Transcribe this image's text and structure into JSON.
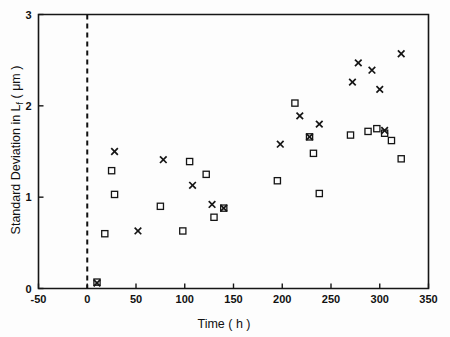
{
  "chart_data": {
    "type": "scatter",
    "title": "",
    "xlabel": "Time ( h )",
    "ylabel_main": "Standard Deviation in L",
    "ylabel_sub": "f",
    "ylabel_units": "( μm )",
    "ylabel_full": "Standard Deviation in Lf ( μm )",
    "xlim": [
      -50,
      350
    ],
    "ylim": [
      0,
      3
    ],
    "xticks": [
      -50,
      0,
      50,
      100,
      150,
      200,
      250,
      300,
      350
    ],
    "xtick_labels": [
      "-50",
      "0",
      "50",
      "100",
      "150",
      "200",
      "250",
      "300",
      "350"
    ],
    "yticks": [
      0,
      1,
      2,
      3
    ],
    "ytick_labels": [
      "0",
      "1",
      "2",
      "3"
    ],
    "grid": false,
    "legend": "none",
    "annotations": [
      {
        "name": "zero-time-reference-line",
        "type": "vertical-dashed-line",
        "x": 0,
        "label": ""
      }
    ],
    "series": [
      {
        "name": "cross-series",
        "marker": "x",
        "color": "#151515",
        "points": [
          [
            10,
            0.06
          ],
          [
            28,
            1.5
          ],
          [
            52,
            0.63
          ],
          [
            78,
            1.41
          ],
          [
            108,
            1.13
          ],
          [
            128,
            0.92
          ],
          [
            140,
            0.88
          ],
          [
            198,
            1.58
          ],
          [
            218,
            1.89
          ],
          [
            228,
            1.66
          ],
          [
            238,
            1.8
          ],
          [
            272,
            2.26
          ],
          [
            278,
            2.47
          ],
          [
            292,
            2.39
          ],
          [
            300,
            2.18
          ],
          [
            305,
            1.73
          ],
          [
            322,
            2.57
          ]
        ]
      },
      {
        "name": "square-series",
        "marker": "square",
        "color": "#151515",
        "points": [
          [
            10,
            0.07
          ],
          [
            18,
            0.6
          ],
          [
            25,
            1.29
          ],
          [
            28,
            1.03
          ],
          [
            75,
            0.9
          ],
          [
            98,
            0.63
          ],
          [
            105,
            1.39
          ],
          [
            122,
            1.25
          ],
          [
            130,
            0.78
          ],
          [
            140,
            0.88
          ],
          [
            195,
            1.18
          ],
          [
            213,
            2.03
          ],
          [
            228,
            1.66
          ],
          [
            232,
            1.48
          ],
          [
            238,
            1.04
          ],
          [
            270,
            1.68
          ],
          [
            288,
            1.72
          ],
          [
            297,
            1.75
          ],
          [
            305,
            1.7
          ],
          [
            312,
            1.62
          ],
          [
            322,
            1.42
          ]
        ]
      }
    ]
  },
  "figure": {
    "background_color": "#ffffff",
    "axis_color": "#161616"
  }
}
